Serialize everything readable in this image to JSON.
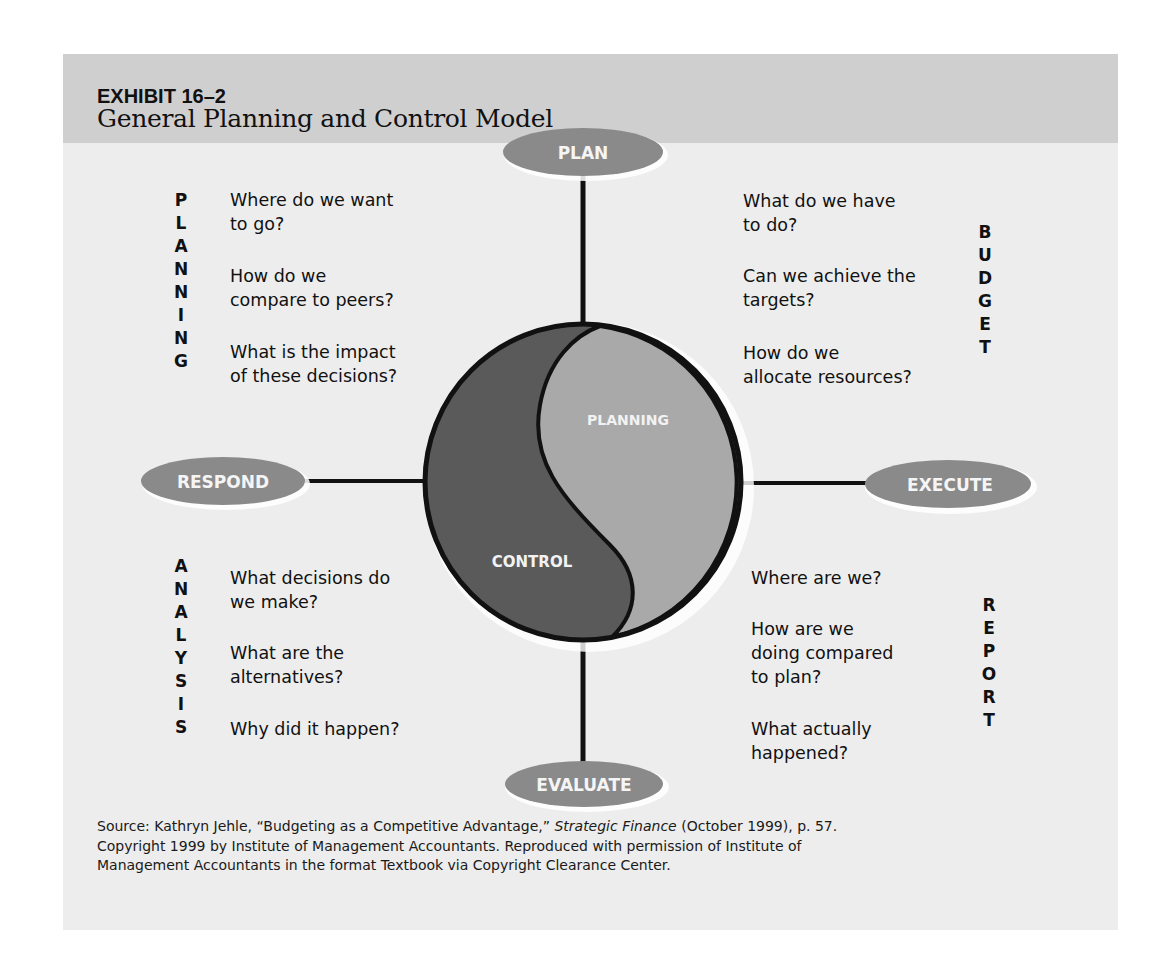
{
  "header": {
    "exhibit_number": "EXHIBIT 16–2",
    "title": "General Planning and Control Model"
  },
  "colors": {
    "header_band": "#cfcfcf",
    "panel_bg": "#ededed",
    "node_fill": "#8a8a8a",
    "control_fill": "#5a5a5a",
    "planning_fill": "#a9a9a9",
    "outline": "#111111"
  },
  "center": {
    "top_half_label": "PLANNING",
    "bottom_half_label": "CONTROL"
  },
  "nodes": {
    "top": "PLAN",
    "right": "EXECUTE",
    "bottom": "EVALUATE",
    "left": "RESPOND"
  },
  "quadrants": {
    "planning": {
      "acronym": [
        "P",
        "L",
        "A",
        "N",
        "N",
        "I",
        "N",
        "G"
      ],
      "questions": [
        {
          "line1": "Where do we want",
          "line2": "to go?"
        },
        {
          "line1": "How do we",
          "line2": "compare to peers?"
        },
        {
          "line1": "What is the impact",
          "line2": "of these decisions?"
        }
      ]
    },
    "budget": {
      "acronym": [
        "B",
        "U",
        "D",
        "G",
        "E",
        "T"
      ],
      "questions": [
        {
          "line1": "What do we have",
          "line2": "to do?"
        },
        {
          "line1": "Can we achieve the",
          "line2": "targets?"
        },
        {
          "line1": "How do we",
          "line2": "allocate resources?"
        }
      ]
    },
    "analysis": {
      "acronym": [
        "A",
        "N",
        "A",
        "L",
        "Y",
        "S",
        "I",
        "S"
      ],
      "questions": [
        {
          "line1": "What decisions do",
          "line2": "we make?"
        },
        {
          "line1": "What are the",
          "line2": "alternatives?"
        },
        {
          "line1": "Why did it happen?",
          "line2": ""
        }
      ]
    },
    "report": {
      "acronym": [
        "R",
        "E",
        "P",
        "O",
        "R",
        "T"
      ],
      "questions": [
        {
          "line1": "Where are we?",
          "line2": "",
          "line3": ""
        },
        {
          "line1": "How are we",
          "line2": "doing compared",
          "line3": "to plan?"
        },
        {
          "line1": "What actually",
          "line2": "happened?",
          "line3": ""
        }
      ]
    }
  },
  "source": {
    "label": "Source:",
    "text_before_italic": " Kathryn Jehle, “Budgeting as a Competitive Advantage,” ",
    "italic": "Strategic Finance",
    "text_after_italic": " (October 1999), p. 57.",
    "line2": "Copyright 1999 by Institute of Management Accountants. Reproduced with permission of Institute of",
    "line3": "Management Accountants in the format Textbook via Copyright Clearance Center."
  }
}
